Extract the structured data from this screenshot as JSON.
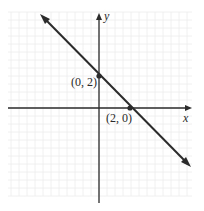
{
  "chart_data": {
    "type": "line",
    "title": "",
    "xlabel": "x",
    "ylabel": "y",
    "grid": true,
    "series": [
      {
        "name": "line",
        "equation": "y = -x + 2",
        "slope": -1,
        "intercept": 2,
        "x": [
          -5.5,
          7
        ],
        "y": [
          7.5,
          -5
        ]
      }
    ],
    "points": [
      {
        "label": "(0, 2)",
        "x": 0,
        "y": 2
      },
      {
        "label": "(2, 0)",
        "x": 2,
        "y": 0
      }
    ],
    "xlim": [
      -5.75,
      5.75
    ],
    "ylim": [
      -5.5,
      6
    ]
  },
  "labels": {
    "x_axis": "x",
    "y_axis": "y",
    "point_a": "(0, 2)",
    "point_b": "(2, 0)"
  },
  "colors": {
    "line": "#2b2b2b",
    "axis": "#2b2b2b",
    "grid": "#ececec",
    "background": "#ffffff"
  }
}
